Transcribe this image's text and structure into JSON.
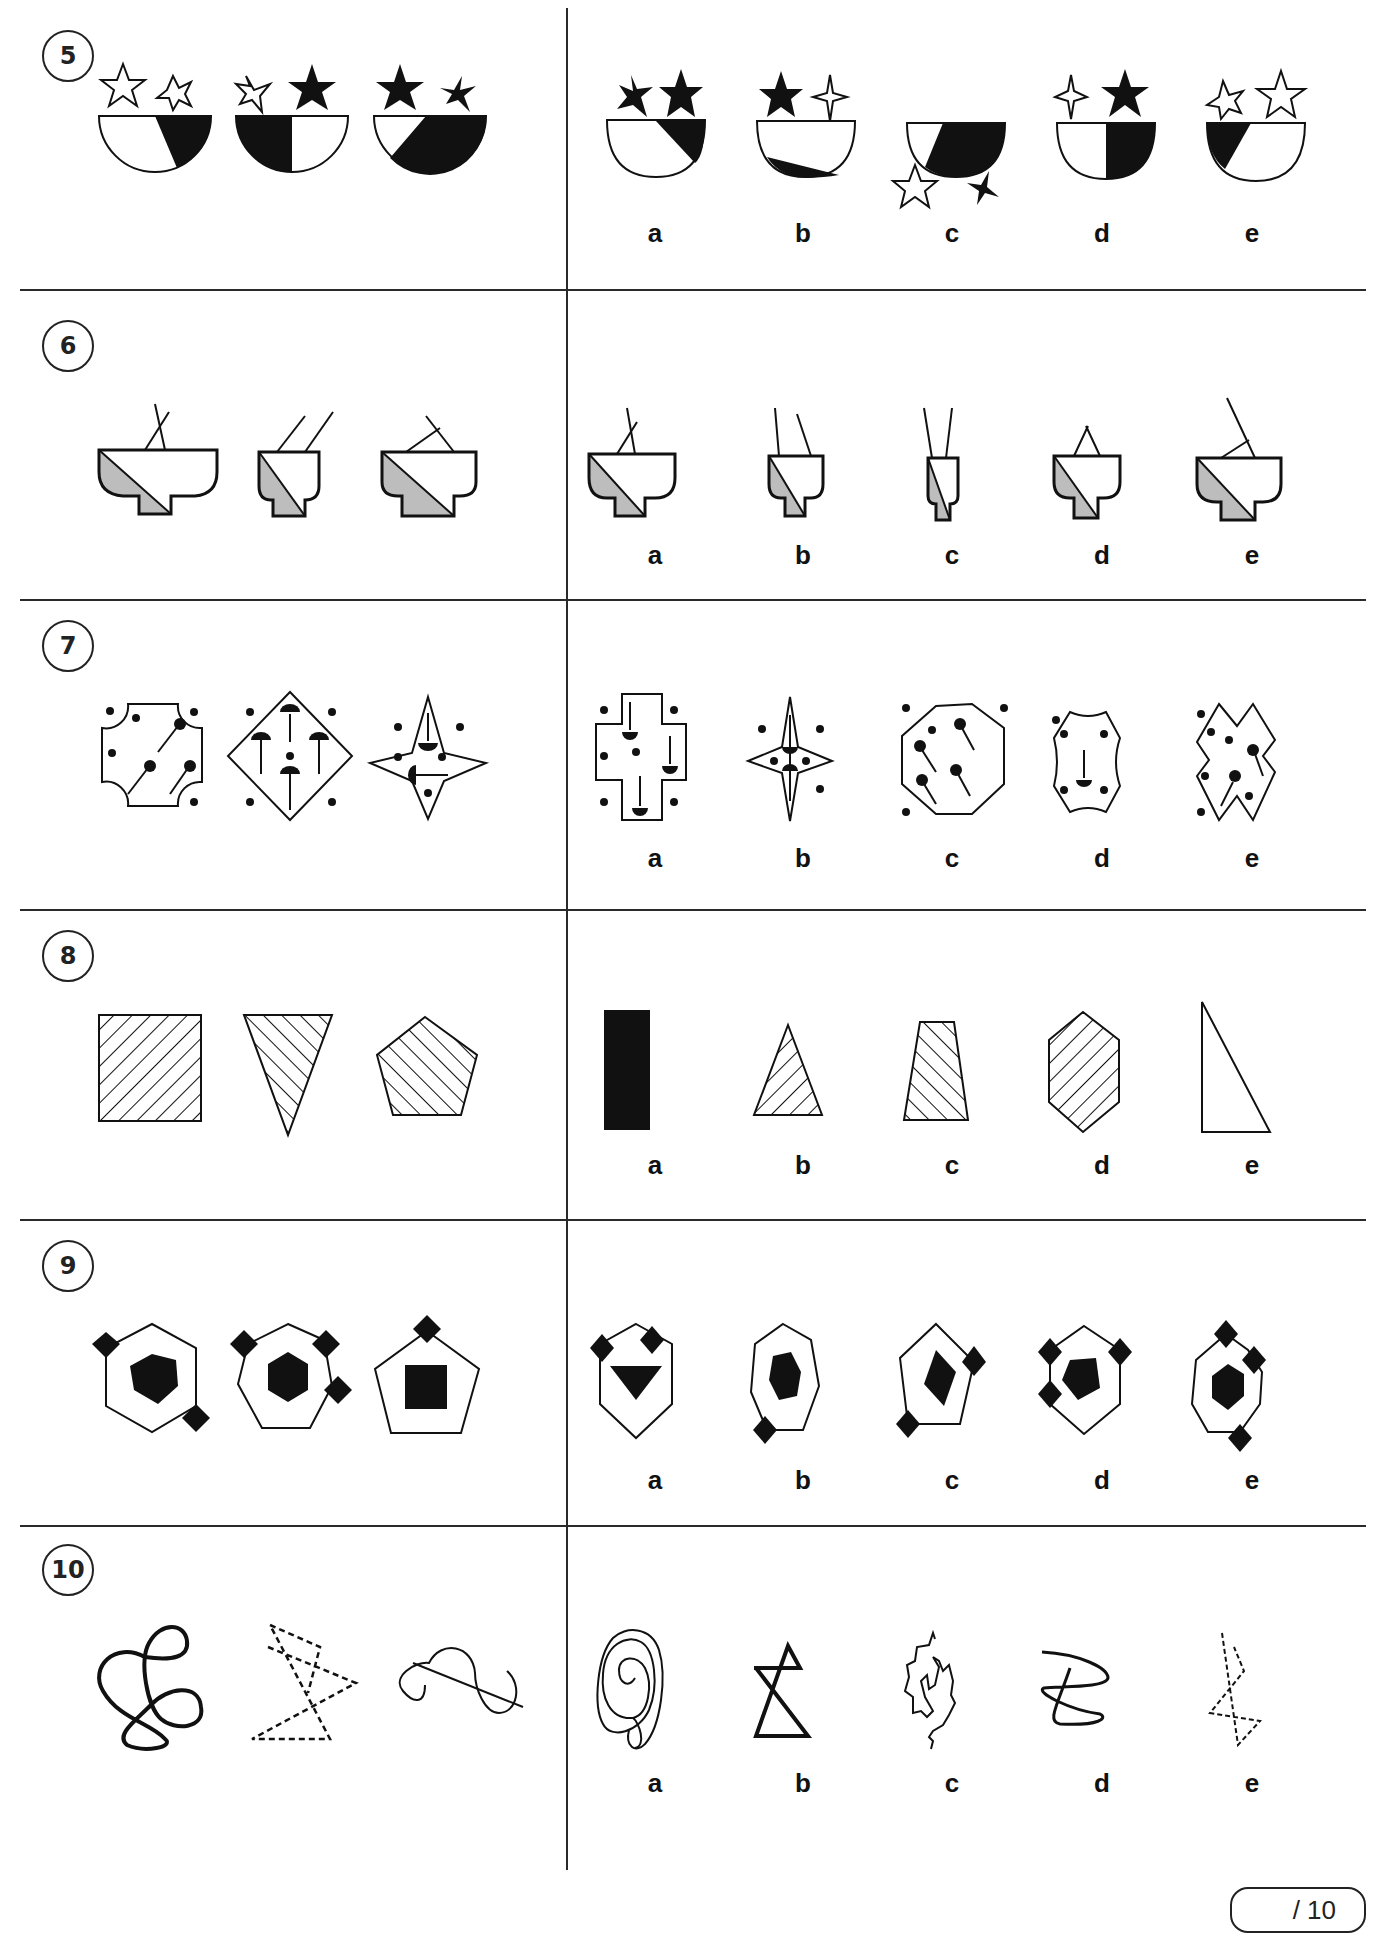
{
  "worksheet": {
    "score_box": "/ 10",
    "questions": [
      {
        "number": "5",
        "theme": "bowls with stars",
        "examples": [
          "bowl-white-right-black-two-white-stars",
          "bowl-left-black-white-star-black-star",
          "bowl-mostly-black-two-black-stars"
        ],
        "options": [
          {
            "label": "a",
            "figure": "bowl-right-black-two-black-stars"
          },
          {
            "label": "b",
            "figure": "bowl-bottom-black-black-star-white-4point-star"
          },
          {
            "label": "c",
            "figure": "bowl-right-black-stars-below"
          },
          {
            "label": "d",
            "figure": "bowl-right-half-black-white-4point-black-star"
          },
          {
            "label": "e",
            "figure": "bowl-left-black-two-white-stars"
          }
        ]
      },
      {
        "number": "6",
        "theme": "grey-split pots with two sticks",
        "examples": [
          "wide-pot-crossed-sticks",
          "narrow-pot-parallel-sticks",
          "medium-pot-crossed-sticks"
        ],
        "options": [
          {
            "label": "a",
            "figure": "wide-pot-crossed-sticks"
          },
          {
            "label": "b",
            "figure": "narrow-pot-splayed-sticks"
          },
          {
            "label": "c",
            "figure": "tall-narrow-pot-converging-sticks"
          },
          {
            "label": "d",
            "figure": "pot-sticks-meet-at-apex"
          },
          {
            "label": "e",
            "figure": "wide-pot-long-crossed-sticks"
          }
        ]
      },
      {
        "number": "7",
        "theme": "shapes with dots and tufts",
        "examples": [
          "notched-square-3-tufts-5-dots",
          "diamond-4-tufts-5-dots",
          "4point-star-2-tufts-6-dots"
        ],
        "options": [
          {
            "label": "a",
            "figure": "cross-3-tufts-7-dots"
          },
          {
            "label": "b",
            "figure": "4point-star-2-tufts-6-dots"
          },
          {
            "label": "c",
            "figure": "octagon-4-tufts-4-dots"
          },
          {
            "label": "d",
            "figure": "notched-hexagon-1-tuft-5-dots"
          },
          {
            "label": "e",
            "figure": "double-diamond-2-tufts-6-dots"
          }
        ]
      },
      {
        "number": "8",
        "theme": "hatched polygons",
        "examples": [
          "hatched-square",
          "hatched-inverted-triangle",
          "hatched-pentagon"
        ],
        "options": [
          {
            "label": "a",
            "figure": "solid-black-rectangle"
          },
          {
            "label": "b",
            "figure": "hatched-triangle"
          },
          {
            "label": "c",
            "figure": "hatched-trapezoid"
          },
          {
            "label": "d",
            "figure": "hatched-hexagon"
          },
          {
            "label": "e",
            "figure": "plain-right-triangle"
          }
        ]
      },
      {
        "number": "9",
        "theme": "outlined polygon with solid inner shape and diamonds",
        "examples": [
          "hexagon-pentagon-2-diamonds",
          "heptagon-hexagon-3-diamonds",
          "pentagon-square-1-diamond"
        ],
        "options": [
          {
            "label": "a",
            "figure": "hexagon-triangle-2-diamonds"
          },
          {
            "label": "b",
            "figure": "heptagon-hexagon-1-diamond"
          },
          {
            "label": "c",
            "figure": "pentagon-square-2-diamonds"
          },
          {
            "label": "d",
            "figure": "hexagon-pentagon-4-diamonds"
          },
          {
            "label": "e",
            "figure": "heptagon-hexagon-3-diamonds"
          }
        ]
      },
      {
        "number": "10",
        "theme": "line drawings",
        "examples": [
          "thick-knotted-loop",
          "dashed-zigzag",
          "thin-wave-with-line"
        ],
        "options": [
          {
            "label": "a",
            "figure": "spiral"
          },
          {
            "label": "b",
            "figure": "thick-hourglass-zigzag"
          },
          {
            "label": "c",
            "figure": "jagged-spiral"
          },
          {
            "label": "d",
            "figure": "scribble-loops"
          },
          {
            "label": "e",
            "figure": "dashed-zigzag"
          }
        ]
      }
    ]
  }
}
